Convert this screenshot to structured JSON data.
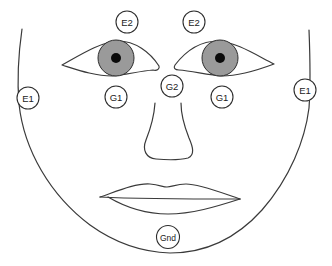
{
  "diagram": {
    "title": "",
    "colors": {
      "outline": "#3a3a3a",
      "iris": "#9a9a9a",
      "pupil": "#0a0a0a",
      "background": "#ffffff"
    },
    "electrodes": [
      {
        "id": "e2-left",
        "label": "E2",
        "cx": 127,
        "cy": 22
      },
      {
        "id": "e2-right",
        "label": "E2",
        "cx": 194,
        "cy": 22
      },
      {
        "id": "e1-left",
        "label": "E1",
        "cx": 28,
        "cy": 98
      },
      {
        "id": "e1-right",
        "label": "E1",
        "cx": 305,
        "cy": 90
      },
      {
        "id": "g1-left",
        "label": "G1",
        "cx": 116,
        "cy": 97
      },
      {
        "id": "g1-right",
        "label": "G1",
        "cx": 222,
        "cy": 97
      },
      {
        "id": "g2",
        "label": "G2",
        "cx": 172,
        "cy": 86
      },
      {
        "id": "gnd",
        "label": "Gnd",
        "cx": 168,
        "cy": 237
      }
    ],
    "features": [
      "face-outline",
      "left-eye",
      "right-eye",
      "nose",
      "lips"
    ]
  }
}
